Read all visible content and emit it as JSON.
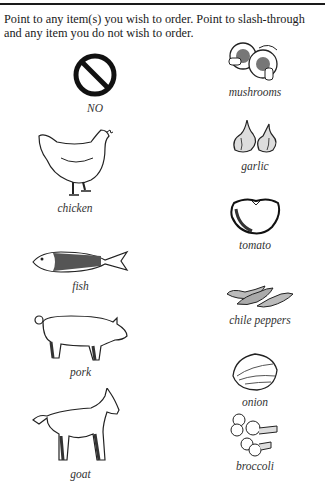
{
  "instructions": "Point to any item(s) you wish to order. Point to slash-through and any item you do not wish to order.",
  "left_column": [
    {
      "id": "no",
      "label": "NO",
      "icon": "no-symbol-icon"
    },
    {
      "id": "chicken",
      "label": "chicken",
      "icon": "chicken-icon"
    },
    {
      "id": "fish",
      "label": "fish",
      "icon": "fish-icon"
    },
    {
      "id": "pork",
      "label": "pork",
      "icon": "pig-icon"
    },
    {
      "id": "goat",
      "label": "goat",
      "icon": "goat-icon"
    }
  ],
  "right_column": [
    {
      "id": "mushrooms",
      "label": "mushrooms",
      "icon": "mushrooms-icon"
    },
    {
      "id": "garlic",
      "label": "garlic",
      "icon": "garlic-icon"
    },
    {
      "id": "tomato",
      "label": "tomato",
      "icon": "tomato-icon"
    },
    {
      "id": "chile-peppers",
      "label": "chile peppers",
      "icon": "chile-peppers-icon"
    },
    {
      "id": "onion",
      "label": "onion",
      "icon": "onion-icon"
    },
    {
      "id": "broccoli",
      "label": "broccoli",
      "icon": "broccoli-icon"
    }
  ]
}
